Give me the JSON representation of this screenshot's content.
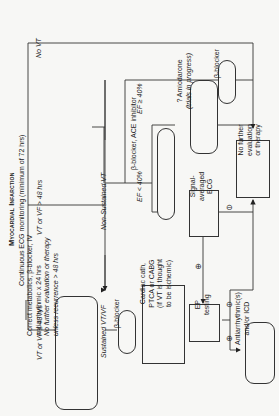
{
  "title": "Myocardial Infarction",
  "subtitle": "Continuous ECG monitoring (minimum of 72 hrs)",
  "branches": {
    "early": "VT or VF ≤ 48 hrs",
    "late": "VT or VF > 48 hrs",
    "no_vt": "No VT",
    "sustained": "Sustained VT/VF",
    "non_sustained": "Non-Sustained VT",
    "ef_low": "EF < 40%",
    "ef_high": "EF ≥ 40%"
  },
  "nodes": {
    "early_tx": [
      "Correct metabolics, β-blocker, IV",
      "antiarrhythmic x 24 hrs",
      "No further evaluation or therapy",
      "unless recurrence > 48 hrs"
    ],
    "bb1": "β-blocker",
    "cath": [
      "Cardiac cath,",
      "PTCA or CABG",
      "(if VT is thought",
      "to be ischemic)"
    ],
    "ep": [
      "EP",
      "testing"
    ],
    "aa": [
      "Antiarrhythmic(s)",
      "and/or ICD"
    ],
    "bb_ace": "β-blocker, ACE inhibitor",
    "saecg": [
      "Signal-",
      "averaged",
      "ECG"
    ],
    "amio": [
      "? Amiodarone",
      "(trials in progress)"
    ],
    "bb2": "β-blocker",
    "nofurther": [
      "No further",
      "evaluation",
      "or therapy"
    ]
  },
  "symbols": {
    "pos": "⊕",
    "neg": "⊖"
  }
}
